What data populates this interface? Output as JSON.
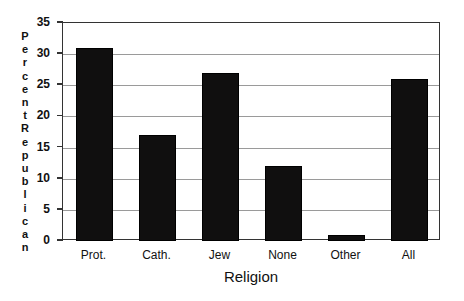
{
  "chart_data": {
    "type": "bar",
    "title": "",
    "xlabel": "Religion",
    "ylabel": "Percent Republican",
    "categories": [
      "Prot.",
      "Cath.",
      "Jew",
      "None",
      "Other",
      "All"
    ],
    "values": [
      31,
      17,
      27,
      12,
      1,
      26
    ],
    "ylim": [
      0,
      35
    ],
    "yticks": [
      0,
      5,
      10,
      15,
      20,
      25,
      30,
      35
    ],
    "ytick_labels": [
      "0",
      "5",
      "10",
      "15",
      "20",
      "25",
      "30",
      "35"
    ],
    "grid": true,
    "grid_axis": "y",
    "legend": false,
    "bar_color": "#100f0f",
    "grid_color": "#9a9a9a",
    "frame_color": "#333333",
    "background": "#ffffff"
  },
  "axes": {
    "y_title_words": [
      "Percent",
      "Republican"
    ],
    "x_title": "Religion"
  }
}
